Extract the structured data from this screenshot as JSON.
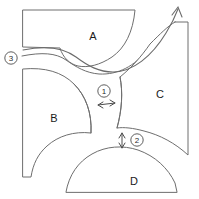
{
  "diagram": {
    "background_color": "#ffffff",
    "line_color": "#6e6e6e",
    "label_color": "#1a1a1a",
    "width": 199,
    "height": 199,
    "regions": [
      {
        "id": "A",
        "label": "A",
        "label_x": 93,
        "label_y": 36
      },
      {
        "id": "B",
        "label": "B",
        "label_x": 54,
        "label_y": 118
      },
      {
        "id": "C",
        "label": "C",
        "label_x": 160,
        "label_y": 94
      },
      {
        "id": "D",
        "label": "D",
        "label_x": 134,
        "label_y": 181
      }
    ],
    "callouts": [
      {
        "id": "1",
        "label": "1",
        "cx": 104,
        "cy": 91,
        "arrow": "horizontal-double"
      },
      {
        "id": "2",
        "label": "2",
        "cx": 137,
        "cy": 140,
        "arrow": "vertical-double"
      },
      {
        "id": "3",
        "label": "3",
        "cx": 11,
        "cy": 58,
        "arrow": "leader"
      }
    ],
    "flow_arrow": {
      "name": "flow-direction-arrow",
      "direction": "up-right"
    }
  }
}
